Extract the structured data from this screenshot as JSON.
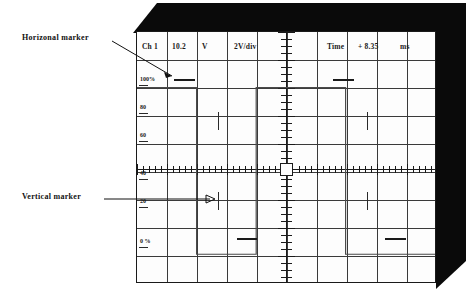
{
  "readout": {
    "channel": "Ch 1",
    "amplitude_value": "10.2",
    "amplitude_unit": "V",
    "volts_per_div": "2V/div",
    "time_label": "Time",
    "time_value": "+ 8.35",
    "time_unit": "ms"
  },
  "vertical_scale": {
    "labels": [
      "100%",
      "80",
      "60",
      "40",
      "20",
      "0 %"
    ]
  },
  "annotations": {
    "horizontal_marker": "Horizonal marker",
    "vertical_marker": "Vertical  marker"
  },
  "grid": {
    "columns": 10,
    "rows": 9
  },
  "chart_data": {
    "type": "line",
    "xlabel": "Time",
    "ylabel": "Amplitude (%)",
    "xlim": [
      0,
      10
    ],
    "ylim": [
      0,
      100
    ],
    "grid": true,
    "legend_position": "none",
    "series": [
      {
        "name": "Ch 1",
        "x": [
          0.0,
          2.0,
          2.0,
          4.0,
          4.0,
          7.0,
          7.0,
          10.0
        ],
        "y": [
          100,
          100,
          0,
          0,
          100,
          100,
          0,
          0
        ]
      }
    ],
    "markers": {
      "horizontal": [
        100,
        0
      ],
      "vertical": [
        2.0,
        7.0
      ]
    }
  },
  "colors": {
    "bezel": "#0a0a0a",
    "screen": "#fdfdfd",
    "grid": "#3a3a3a",
    "trace": "#4a4a4a",
    "axis": "#1a1a1a"
  }
}
